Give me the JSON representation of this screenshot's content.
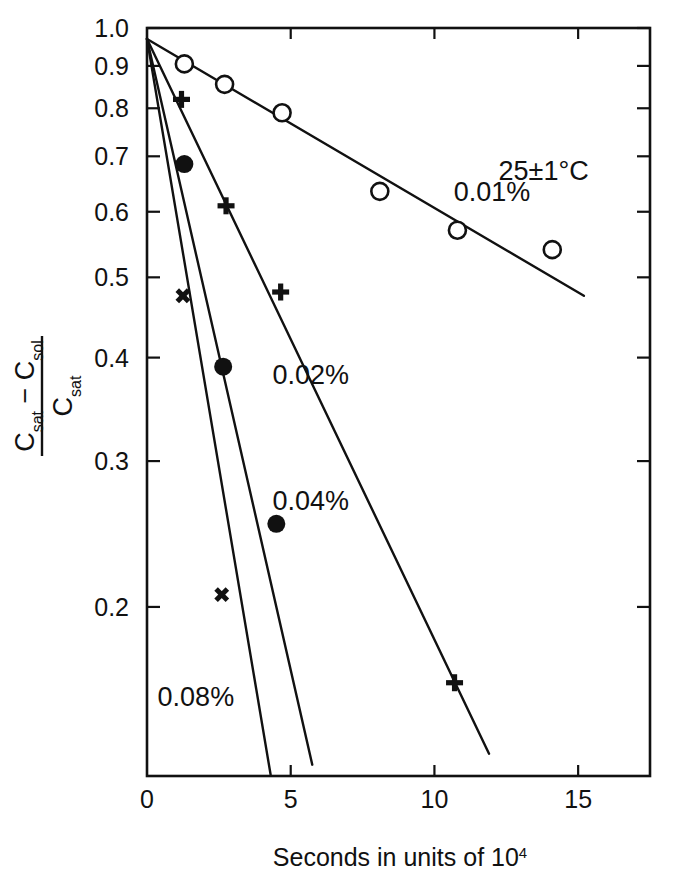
{
  "chart_data": {
    "type": "scatter",
    "title": "",
    "subtitle": "",
    "xlabel": "Seconds in units of 10⁴",
    "xlabel_base": "Seconds  in  units  of  10",
    "xlabel_exponent": "4",
    "ylabel_numerator": "Cₛₐₜ − Cₛₒₗ",
    "ylabel_denominator": "Cₛₐₜ",
    "ylabel_num_parts": {
      "c1": "C",
      "sub1": "sat",
      "minus": "−",
      "c2": "C",
      "sub2": "sol"
    },
    "ylabel_den_parts": {
      "c3": "C",
      "sub3": "sat"
    },
    "yscale": "log",
    "xscale": "linear",
    "xlim": [
      0,
      17.5
    ],
    "ylim": [
      0.125,
      1.0
    ],
    "grid": false,
    "legend": "inline-annotations",
    "xticks": [
      0,
      5,
      10,
      15
    ],
    "xticklabels": [
      "0",
      "5",
      "10",
      "15"
    ],
    "yticks": [
      1.0,
      0.9,
      0.8,
      0.7,
      0.6,
      0.5,
      0.4,
      0.3,
      0.2
    ],
    "yticklabels": [
      "1.0",
      "0.9",
      "0.8",
      "0.7",
      "0.6",
      "0.5",
      "0.4",
      "0.3",
      "0.2"
    ],
    "annotations": [
      {
        "text": "25±1°C",
        "x": 13.8,
        "y": 0.655,
        "name": "temperature-annotation"
      },
      {
        "text": "0.01%",
        "x": 12.0,
        "y": 0.618,
        "name": "series-label-001"
      },
      {
        "text": "0.02%",
        "x": 5.7,
        "y": 0.372,
        "name": "series-label-002"
      },
      {
        "text": "0.04%",
        "x": 5.7,
        "y": 0.262,
        "name": "series-label-004"
      },
      {
        "text": "0.08%",
        "x": 1.7,
        "y": 0.152,
        "name": "series-label-008"
      }
    ],
    "series": [
      {
        "name": "0.01%",
        "label": "0.01%",
        "marker": "open-circle",
        "color": "#111111",
        "points": [
          {
            "x": 1.3,
            "y": 0.905
          },
          {
            "x": 2.7,
            "y": 0.855
          },
          {
            "x": 4.7,
            "y": 0.79
          },
          {
            "x": 8.1,
            "y": 0.635
          },
          {
            "x": 10.8,
            "y": 0.57
          },
          {
            "x": 14.1,
            "y": 0.54
          }
        ],
        "fit_line": {
          "x1": 0.0,
          "y1": 0.97,
          "x2": 15.2,
          "y2": 0.475
        }
      },
      {
        "name": "0.02%",
        "label": "0.02%",
        "marker": "plus",
        "color": "#111111",
        "points": [
          {
            "x": 1.2,
            "y": 0.82
          },
          {
            "x": 2.75,
            "y": 0.61
          },
          {
            "x": 4.65,
            "y": 0.48
          },
          {
            "x": 10.7,
            "y": 0.162
          }
        ],
        "fit_line": {
          "x1": 0.0,
          "y1": 0.97,
          "x2": 11.9,
          "y2": 0.133
        }
      },
      {
        "name": "0.04%",
        "label": "0.04%",
        "marker": "filled-circle",
        "color": "#111111",
        "points": [
          {
            "x": 1.3,
            "y": 0.685
          },
          {
            "x": 2.65,
            "y": 0.39
          },
          {
            "x": 4.5,
            "y": 0.252
          }
        ],
        "fit_line": {
          "x1": 0.0,
          "y1": 0.97,
          "x2": 5.75,
          "y2": 0.129
        }
      },
      {
        "name": "0.08%",
        "label": "0.08%",
        "marker": "cross-x",
        "color": "#111111",
        "points": [
          {
            "x": 1.25,
            "y": 0.475
          },
          {
            "x": 2.6,
            "y": 0.207
          }
        ],
        "fit_line": {
          "x1": 0.0,
          "y1": 0.97,
          "x2": 4.3,
          "y2": 0.1255
        }
      }
    ]
  },
  "figure": {
    "axes_color": "#111111",
    "background": "#ffffff"
  }
}
